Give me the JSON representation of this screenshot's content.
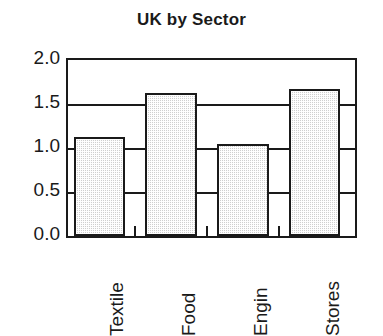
{
  "chart_data": {
    "type": "bar",
    "title": "UK by Sector",
    "xlabel": "",
    "ylabel": "",
    "categories": [
      "Textile",
      "Food",
      "Engin",
      "Stores"
    ],
    "values": [
      1.13,
      1.62,
      1.04,
      1.67
    ],
    "ylim": [
      0.0,
      2.0
    ],
    "yticks": [
      "0.0",
      "0.5",
      "1.0",
      "1.5",
      "2.0"
    ],
    "ytick_values": [
      0.0,
      0.5,
      1.0,
      1.5,
      2.0
    ],
    "grid": true,
    "grid_axis": "y",
    "legend": false,
    "legend_position": "none",
    "bar_fill_color": "#cfcfcf",
    "bar_edge_color": "#1a1a1a",
    "axis_color": "#1a1a1a",
    "background_color": "#ffffff"
  }
}
